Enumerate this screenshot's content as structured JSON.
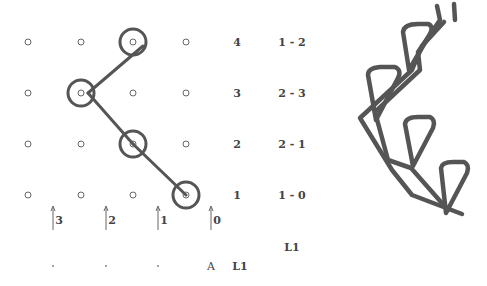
{
  "diagram": {
    "grid": {
      "columns_x": [
        28,
        81,
        133,
        186
      ],
      "rows_y": [
        42,
        93,
        144,
        195
      ],
      "dot_color": "#666666",
      "dot_radius": 3
    },
    "path": {
      "color": "#555555",
      "stroke_width": 3,
      "circle_radius": 13,
      "nodes": [
        {
          "col": 2,
          "row": 0
        },
        {
          "col": 1,
          "row": 1
        },
        {
          "col": 2,
          "row": 2
        },
        {
          "col": 3,
          "row": 3
        }
      ]
    },
    "level_labels": [
      {
        "text": "4",
        "y": 42
      },
      {
        "text": "3",
        "y": 93
      },
      {
        "text": "2",
        "y": 144
      },
      {
        "text": "1",
        "y": 195
      }
    ],
    "pair_labels": [
      {
        "text": "1 - 2",
        "y": 42
      },
      {
        "text": "2 - 3",
        "y": 93
      },
      {
        "text": "2 - 1",
        "y": 144
      },
      {
        "text": "1 - 0",
        "y": 195
      }
    ],
    "arrows": [
      {
        "label": "3",
        "x": 53
      },
      {
        "label": "2",
        "x": 106
      },
      {
        "label": "1",
        "x": 158
      },
      {
        "label": "0",
        "x": 211
      }
    ],
    "bottom": {
      "dots_x": [
        53,
        106,
        158
      ],
      "a_label": "A",
      "l1_label": "L1",
      "l1_upper_label": "L1"
    },
    "shape3d": {
      "stroke_color": "#555555",
      "description": "3D zigzag strand with four loop cones"
    }
  }
}
